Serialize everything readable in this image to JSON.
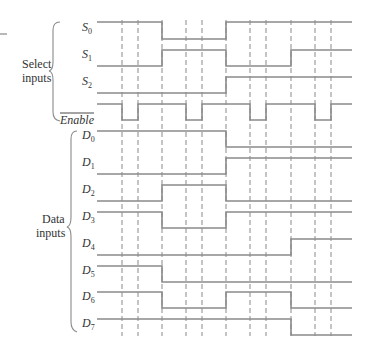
{
  "groups": {
    "select": {
      "label_line1": "Select",
      "label_line2": "inputs"
    },
    "data": {
      "label_line1": "Data",
      "label_line2": "inputs"
    }
  },
  "time_axis": {
    "x_start": 97,
    "x_end": 352,
    "dashed_lines_x": [
      122,
      138,
      162,
      186,
      202,
      226,
      250,
      266,
      291,
      315,
      331
    ],
    "dashed_top": 20,
    "dashed_bottom": 336
  },
  "signals": [
    {
      "id": "S0",
      "base": "S",
      "sub": "0",
      "overbar": false,
      "y_high": 22,
      "y_low": 39,
      "levels": [
        [
          97,
          1
        ],
        [
          162,
          0
        ],
        [
          226,
          1
        ]
      ]
    },
    {
      "id": "S1",
      "base": "S",
      "sub": "1",
      "overbar": false,
      "y_high": 50,
      "y_low": 66,
      "levels": [
        [
          97,
          0
        ],
        [
          162,
          1
        ],
        [
          226,
          0
        ],
        [
          291,
          1
        ]
      ]
    },
    {
      "id": "S2",
      "base": "S",
      "sub": "2",
      "overbar": false,
      "y_high": 77,
      "y_low": 93,
      "levels": [
        [
          97,
          0
        ],
        [
          226,
          1
        ]
      ]
    },
    {
      "id": "Enable",
      "base": "Enable",
      "sub": "",
      "overbar": true,
      "y_high": 104,
      "y_low": 120,
      "levels": [
        [
          97,
          1
        ],
        [
          122,
          0
        ],
        [
          138,
          1
        ],
        [
          186,
          0
        ],
        [
          202,
          1
        ],
        [
          250,
          0
        ],
        [
          266,
          1
        ],
        [
          315,
          0
        ],
        [
          331,
          1
        ]
      ]
    },
    {
      "id": "D0",
      "base": "D",
      "sub": "0",
      "overbar": false,
      "y_high": 131,
      "y_low": 147,
      "levels": [
        [
          97,
          1
        ],
        [
          226,
          0
        ]
      ]
    },
    {
      "id": "D1",
      "base": "D",
      "sub": "1",
      "overbar": false,
      "y_high": 158,
      "y_low": 174,
      "levels": [
        [
          97,
          0
        ],
        [
          226,
          1
        ]
      ]
    },
    {
      "id": "D2",
      "base": "D",
      "sub": "2",
      "overbar": false,
      "y_high": 185,
      "y_low": 201,
      "levels": [
        [
          97,
          0
        ],
        [
          162,
          1
        ],
        [
          226,
          0
        ]
      ]
    },
    {
      "id": "D3",
      "base": "D",
      "sub": "3",
      "overbar": false,
      "y_high": 212,
      "y_low": 228,
      "levels": [
        [
          97,
          1
        ],
        [
          162,
          0
        ],
        [
          226,
          1
        ]
      ]
    },
    {
      "id": "D4",
      "base": "D",
      "sub": "4",
      "overbar": false,
      "y_high": 239,
      "y_low": 255,
      "levels": [
        [
          97,
          0
        ],
        [
          291,
          1
        ]
      ]
    },
    {
      "id": "D5",
      "base": "D",
      "sub": "5",
      "overbar": false,
      "y_high": 266,
      "y_low": 282,
      "levels": [
        [
          97,
          1
        ],
        [
          162,
          0
        ]
      ]
    },
    {
      "id": "D6",
      "base": "D",
      "sub": "6",
      "overbar": false,
      "y_high": 292,
      "y_low": 308,
      "levels": [
        [
          97,
          1
        ],
        [
          162,
          0
        ],
        [
          226,
          1
        ],
        [
          291,
          0
        ]
      ]
    },
    {
      "id": "D7",
      "base": "D",
      "sub": "7",
      "overbar": false,
      "y_high": 319,
      "y_low": 335,
      "levels": [
        [
          97,
          1
        ],
        [
          291,
          0
        ]
      ]
    }
  ],
  "style": {
    "line_color": "#8a8a8a",
    "text_color": "#333333",
    "background": "#ffffff"
  }
}
